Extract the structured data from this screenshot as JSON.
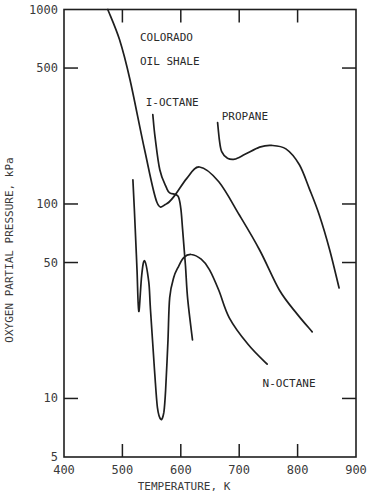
{
  "chart_data": {
    "type": "line",
    "title": "",
    "xlabel": "TEMPERATURE, K",
    "ylabel": "OXYGEN PARTIAL PRESSURE, kPa",
    "xlim": [
      400,
      900
    ],
    "ylim": [
      5,
      1000
    ],
    "yscale": "log",
    "x_ticks": [
      400,
      500,
      600,
      700,
      800,
      900
    ],
    "x_tick_labels": [
      "400",
      "500",
      "600",
      "700",
      "800",
      "900"
    ],
    "y_ticks": [
      5,
      10,
      50,
      100,
      500,
      1000
    ],
    "y_tick_labels": [
      "5",
      "10",
      "50",
      "100",
      "500",
      "1000"
    ],
    "grid": false,
    "legend": "none (curves labeled directly)",
    "series": [
      {
        "name": "COLORADO OIL SHALE",
        "label_lines": [
          "COLORADO",
          "OIL SHALE"
        ],
        "x": [
          475,
          495,
          513,
          538,
          559,
          575,
          589,
          610,
          632,
          665,
          700,
          735,
          769,
          800,
          825
        ],
        "y": [
          1000,
          700,
          435,
          190,
          102,
          100,
          110,
          135,
          155,
          130,
          88,
          58,
          36,
          27,
          22
        ]
      },
      {
        "name": "I-OCTANE",
        "label_lines": [
          "I-OCTANE"
        ],
        "x": [
          552,
          556,
          564,
          575,
          581,
          595,
          600,
          603,
          608,
          612,
          620
        ],
        "y": [
          288,
          220,
          150,
          122,
          114,
          110,
          95,
          74,
          48,
          32,
          20
        ]
      },
      {
        "name": "PROPANE",
        "label_lines": [
          "PROPANE"
        ],
        "x": [
          663,
          666,
          670,
          680,
          692,
          710,
          735,
          755,
          780,
          803,
          820,
          837,
          855,
          871
        ],
        "y": [
          262,
          215,
          186,
          172,
          170,
          180,
          196,
          200,
          192,
          159,
          120,
          88,
          58,
          37
        ]
      },
      {
        "name": "N-OCTANE",
        "label_lines": [
          "N-OCTANE"
        ],
        "x": [
          518,
          522,
          525,
          528,
          533,
          538,
          545,
          548,
          555,
          560,
          566,
          571,
          574,
          578,
          581,
          588,
          595,
          605,
          618,
          635,
          649,
          665,
          683,
          715,
          748
        ],
        "y": [
          133,
          75,
          46,
          28,
          43,
          51,
          40,
          29,
          14,
          9,
          7.8,
          8.5,
          11,
          20,
          33,
          42,
          47,
          53,
          55,
          52,
          46,
          36,
          26,
          19,
          15
        ]
      }
    ],
    "annotations": [
      {
        "text": "COLORADO",
        "x": 530,
        "y": 690
      },
      {
        "text": "OIL SHALE",
        "x": 530,
        "y": 520
      },
      {
        "text": "I-OCTANE",
        "x": 540,
        "y": 320
      },
      {
        "text": "PROPANE",
        "x": 670,
        "y": 270
      },
      {
        "text": "N-OCTANE",
        "x": 740,
        "y": 11.5
      }
    ]
  }
}
